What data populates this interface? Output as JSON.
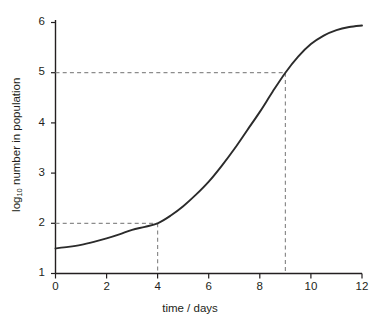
{
  "chart_data": {
    "type": "line",
    "title": "",
    "xlabel": "time / days",
    "ylabel_prefix": "log",
    "ylabel_subscript": "10",
    "ylabel_suffix": " number in population",
    "ylabel_full": "log10 number in population",
    "xlim": [
      0,
      12
    ],
    "ylim": [
      1,
      6
    ],
    "xticks": [
      0,
      2,
      4,
      6,
      8,
      10,
      12
    ],
    "xtick_labels": [
      "0",
      "2",
      "4",
      "6",
      "8",
      "10",
      "12"
    ],
    "yticks": [
      1,
      2,
      3,
      4,
      5,
      6
    ],
    "ytick_labels": [
      "1",
      "2",
      "3",
      "4",
      "5",
      "6"
    ],
    "grid": false,
    "legend": null,
    "series": [
      {
        "name": "population growth",
        "style": "solid",
        "color": "#2b2b2b",
        "x": [
          0,
          0.5,
          1,
          1.5,
          2,
          2.5,
          3,
          3.5,
          4,
          4.5,
          5,
          5.5,
          6,
          6.5,
          7,
          7.5,
          8,
          8.5,
          9,
          9.5,
          10,
          10.5,
          11,
          11.5,
          12
        ],
        "y": [
          1.5,
          1.53,
          1.57,
          1.63,
          1.7,
          1.78,
          1.87,
          1.93,
          2.0,
          2.15,
          2.34,
          2.57,
          2.83,
          3.14,
          3.48,
          3.85,
          4.22,
          4.62,
          5.0,
          5.32,
          5.57,
          5.74,
          5.85,
          5.91,
          5.94
        ]
      }
    ],
    "annotations": [
      {
        "name": "guideline-lower",
        "style": "dashed",
        "color": "#8c8c8c",
        "x_value": 4,
        "y_value": 2,
        "description": "dashed lines from y-axis at 2 to curve at x = 4, then down to x-axis"
      },
      {
        "name": "guideline-upper",
        "style": "dashed",
        "color": "#8c8c8c",
        "x_value": 9,
        "y_value": 5,
        "description": "dashed lines from y-axis at 5 to curve at x = 9, then down to x-axis"
      }
    ],
    "axis_color": "#231f20",
    "background_color": "#ffffff"
  }
}
